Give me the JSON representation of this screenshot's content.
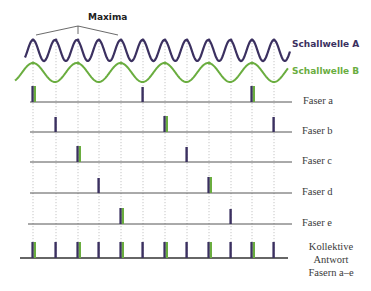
{
  "diagram": {
    "title_label": "Maxima",
    "colors": {
      "wave_a": "#3b3060",
      "wave_b": "#6aad3f",
      "spike_dark": "#3b3060",
      "spike_green": "#6aad3f",
      "baseline": "#555555",
      "gridline": "#b8b8b8"
    },
    "waves": [
      {
        "name": "Schallwelle A",
        "label": "Schallwelle A",
        "color": "#3b3060",
        "period_px": 21.9,
        "peak_y": 40,
        "trough_y": 61
      },
      {
        "name": "Schallwelle B",
        "label": "Schallwelle B",
        "color": "#6aad3f",
        "period_px": 43.8,
        "peak_y": 63,
        "trough_y": 82
      }
    ],
    "maxima_pointer_x": [
      33,
      78,
      121
    ],
    "gridline_x": [
      33,
      56,
      78,
      99,
      121,
      143,
      165,
      187,
      209,
      231,
      252,
      274
    ],
    "rows": [
      {
        "label": "Faser a",
        "baseline_y": 102,
        "spikes": [
          {
            "x": 33,
            "green": true
          },
          {
            "x": 143,
            "green": false
          },
          {
            "x": 252,
            "green": true
          }
        ]
      },
      {
        "label": "Faser b",
        "baseline_y": 132,
        "spikes": [
          {
            "x": 56,
            "green": false
          },
          {
            "x": 165,
            "green": true
          },
          {
            "x": 274,
            "green": false
          }
        ]
      },
      {
        "label": "Faser c",
        "baseline_y": 162,
        "spikes": [
          {
            "x": 78,
            "green": true
          },
          {
            "x": 187,
            "green": false
          }
        ]
      },
      {
        "label": "Faser d",
        "baseline_y": 193,
        "spikes": [
          {
            "x": 99,
            "green": false
          },
          {
            "x": 209,
            "green": true
          }
        ]
      },
      {
        "label": "Faser e",
        "baseline_y": 224,
        "spikes": [
          {
            "x": 121,
            "green": true
          },
          {
            "x": 231,
            "green": false
          }
        ]
      }
    ],
    "collective": {
      "label_lines": [
        "Kollektive",
        "Antwort",
        "Fasern a–e"
      ],
      "baseline_y": 258,
      "spikes": [
        {
          "x": 33,
          "green": true
        },
        {
          "x": 56,
          "green": false
        },
        {
          "x": 78,
          "green": true
        },
        {
          "x": 99,
          "green": false
        },
        {
          "x": 121,
          "green": true
        },
        {
          "x": 143,
          "green": false
        },
        {
          "x": 165,
          "green": true
        },
        {
          "x": 187,
          "green": false
        },
        {
          "x": 209,
          "green": true
        },
        {
          "x": 231,
          "green": false
        },
        {
          "x": 252,
          "green": true
        },
        {
          "x": 274,
          "green": false
        }
      ]
    }
  }
}
